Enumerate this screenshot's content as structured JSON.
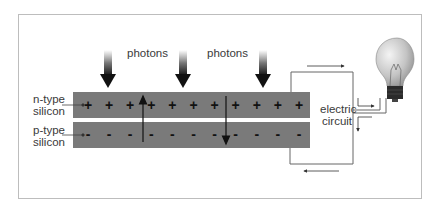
{
  "labels": {
    "photons_1": "photons",
    "photons_2": "photons",
    "n_type_line1": "n-type",
    "n_type_line2": "silicon",
    "p_type_line1": "p-type",
    "p_type_line2": "silicon",
    "circuit_line1": "electric",
    "circuit_line2": "circuit"
  },
  "n_layer": {
    "charge_sign": "+",
    "count": 11
  },
  "p_layer": {
    "charge_sign": "-",
    "count": 11
  },
  "colors": {
    "silicon_band": "#7a7a7a",
    "frame": "#bdbdbd",
    "wire": "#555555",
    "text": "#3a3a3a",
    "bulb_glass": "#c9c9c9",
    "bulb_base": "#2b2b2b"
  },
  "icons": {
    "photon_arrow": "down-arrow-gradient",
    "light_bulb": "incandescent-bulb"
  }
}
